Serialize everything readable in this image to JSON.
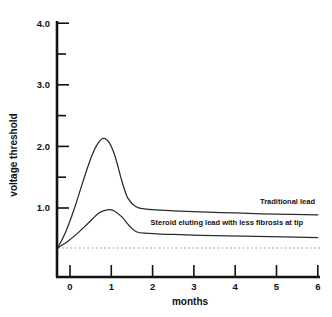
{
  "chart_data": {
    "type": "line",
    "title": "",
    "xlabel": "months",
    "ylabel": "voltage threshold",
    "xlim": [
      -0.35,
      6
    ],
    "ylim": [
      0,
      4.0
    ],
    "grid": false,
    "legend_position": "inline-right",
    "x_ticks": [
      {
        "value": 0,
        "label": "0"
      },
      {
        "value": 1,
        "label": "1"
      },
      {
        "value": 2,
        "label": "2"
      },
      {
        "value": 3,
        "label": "3"
      },
      {
        "value": 4,
        "label": "4"
      },
      {
        "value": 5,
        "label": "5"
      },
      {
        "value": 6,
        "label": "6"
      }
    ],
    "y_ticks": [
      {
        "value": 1.0,
        "label": "1.0",
        "minor": false
      },
      {
        "value": 1.5,
        "label": "",
        "minor": true
      },
      {
        "value": 2.0,
        "label": "2.0",
        "minor": false
      },
      {
        "value": 2.5,
        "label": "",
        "minor": true
      },
      {
        "value": 3.0,
        "label": "3.0",
        "minor": false
      },
      {
        "value": 3.5,
        "label": "",
        "minor": true
      },
      {
        "value": 4.0,
        "label": "4.0",
        "minor": false
      }
    ],
    "reference_line": {
      "value": 0.35,
      "style": "dotted",
      "label": ""
    },
    "series": [
      {
        "name": "Traditional lead",
        "style": "solid",
        "label_x": 4.6,
        "label_y": 1.06,
        "points": [
          {
            "x": -0.3,
            "y": 0.35
          },
          {
            "x": -0.1,
            "y": 0.62
          },
          {
            "x": 0.1,
            "y": 0.98
          },
          {
            "x": 0.3,
            "y": 1.4
          },
          {
            "x": 0.5,
            "y": 1.8
          },
          {
            "x": 0.65,
            "y": 2.02
          },
          {
            "x": 0.8,
            "y": 2.13
          },
          {
            "x": 0.95,
            "y": 2.06
          },
          {
            "x": 1.1,
            "y": 1.82
          },
          {
            "x": 1.25,
            "y": 1.45
          },
          {
            "x": 1.4,
            "y": 1.16
          },
          {
            "x": 1.6,
            "y": 1.02
          },
          {
            "x": 1.85,
            "y": 0.98
          },
          {
            "x": 2.3,
            "y": 0.96
          },
          {
            "x": 3.0,
            "y": 0.94
          },
          {
            "x": 4.0,
            "y": 0.92
          },
          {
            "x": 5.0,
            "y": 0.9
          },
          {
            "x": 6.0,
            "y": 0.89
          }
        ]
      },
      {
        "name": "Steroid eluting lead with less fibrosis at tip",
        "style": "solid",
        "label_x": 1.95,
        "label_y": 0.72,
        "points": [
          {
            "x": -0.3,
            "y": 0.35
          },
          {
            "x": -0.05,
            "y": 0.46
          },
          {
            "x": 0.2,
            "y": 0.6
          },
          {
            "x": 0.45,
            "y": 0.76
          },
          {
            "x": 0.7,
            "y": 0.92
          },
          {
            "x": 0.9,
            "y": 0.97
          },
          {
            "x": 1.05,
            "y": 0.96
          },
          {
            "x": 1.25,
            "y": 0.86
          },
          {
            "x": 1.45,
            "y": 0.7
          },
          {
            "x": 1.62,
            "y": 0.61
          },
          {
            "x": 1.9,
            "y": 0.59
          },
          {
            "x": 2.5,
            "y": 0.57
          },
          {
            "x": 3.5,
            "y": 0.55
          },
          {
            "x": 4.5,
            "y": 0.54
          },
          {
            "x": 6.0,
            "y": 0.52
          }
        ]
      }
    ]
  },
  "axes": {
    "y_title": "voltage threshold",
    "x_title": "months"
  },
  "colors": {
    "axis": "#111111",
    "curve": "#2a2a2a",
    "reference": "#9a9a9a",
    "background": "#ffffff"
  }
}
